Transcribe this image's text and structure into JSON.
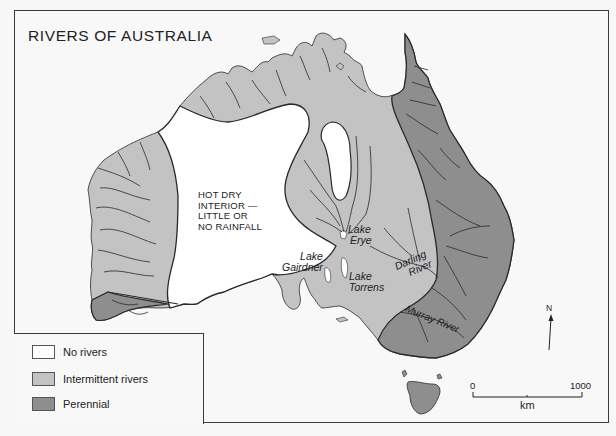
{
  "title": "RIVERS OF AUSTRALIA",
  "colors": {
    "no_rivers": "#ffffff",
    "intermittent": "#c3c3c3",
    "perennial": "#8e8e8e",
    "outline": "#2a2a2a",
    "background": "#f8f8f8"
  },
  "map_labels": {
    "interior": [
      "HOT DRY",
      "INTERIOR —",
      "LITTLE OR",
      "NO RAINFALL"
    ],
    "lake_erye": [
      "Lake",
      "Erye"
    ],
    "lake_gairdner": [
      "Lake",
      "Gairdner"
    ],
    "lake_torrens": [
      "Lake",
      "Torrens"
    ],
    "darling_river": [
      "Darling",
      "River"
    ],
    "murray_river": "Murray River"
  },
  "legend": {
    "items": [
      {
        "label": "No rivers",
        "color": "#ffffff"
      },
      {
        "label": "Intermittent rivers",
        "color": "#c3c3c3"
      },
      {
        "label": "Perennial",
        "color": "#8e8e8e"
      }
    ]
  },
  "scale_bar": {
    "start": "0",
    "end": "1000",
    "unit": "km"
  },
  "north_arrow": {
    "label": "N"
  }
}
